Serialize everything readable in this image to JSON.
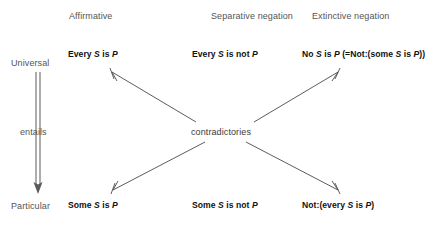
{
  "diagram": {
    "background_color": "#ffffff",
    "line_color": "#4a4a4a",
    "text_color": "#111111",
    "muted_text_color": "#555555"
  },
  "columns": [
    {
      "label": "Affirmative"
    },
    {
      "label": "Separative negation"
    },
    {
      "label": "Extinctive negation"
    }
  ],
  "rows": [
    {
      "label": "Universal"
    },
    {
      "label": "Particular"
    }
  ],
  "relation": {
    "vertical_label": "entails",
    "diagonal_label": "contradictories"
  },
  "propositions": {
    "universal": [
      {
        "column": "Affirmative",
        "parts": [
          {
            "text": "Every ",
            "italic": false
          },
          {
            "text": "S",
            "italic": true
          },
          {
            "text": " is ",
            "italic": false
          },
          {
            "text": "P",
            "italic": true
          }
        ],
        "plain": "Every S is P"
      },
      {
        "column": "Separative negation",
        "parts": [
          {
            "text": "Every ",
            "italic": false
          },
          {
            "text": "S",
            "italic": true
          },
          {
            "text": " is not ",
            "italic": false
          },
          {
            "text": "P",
            "italic": true
          }
        ],
        "plain": "Every S is not P"
      },
      {
        "column": "Extinctive negation",
        "parts": [
          {
            "text": "No ",
            "italic": false
          },
          {
            "text": "S",
            "italic": true
          },
          {
            "text": " is ",
            "italic": false
          },
          {
            "text": "P",
            "italic": true
          },
          {
            "text": " (=Not:(some ",
            "italic": false
          },
          {
            "text": "S",
            "italic": true
          },
          {
            "text": " is ",
            "italic": false
          },
          {
            "text": "P",
            "italic": true
          },
          {
            "text": "))",
            "italic": false
          }
        ],
        "plain": "No S is P (=Not:(some S is P))"
      }
    ],
    "particular": [
      {
        "column": "Affirmative",
        "parts": [
          {
            "text": "Some ",
            "italic": false
          },
          {
            "text": "S",
            "italic": true
          },
          {
            "text": " is ",
            "italic": false
          },
          {
            "text": "P",
            "italic": true
          }
        ],
        "plain": "Some S is P"
      },
      {
        "column": "Separative negation",
        "parts": [
          {
            "text": "Some ",
            "italic": false
          },
          {
            "text": "S",
            "italic": true
          },
          {
            "text": " is not ",
            "italic": false
          },
          {
            "text": "P",
            "italic": true
          }
        ],
        "plain": "Some S is not P"
      },
      {
        "column": "Extinctive negation",
        "parts": [
          {
            "text": "Not:(every ",
            "italic": false
          },
          {
            "text": "S",
            "italic": true
          },
          {
            "text": " is ",
            "italic": false
          },
          {
            "text": "P",
            "italic": true
          },
          {
            "text": ")",
            "italic": false
          }
        ],
        "plain": "Not:(every S is P)"
      }
    ]
  }
}
